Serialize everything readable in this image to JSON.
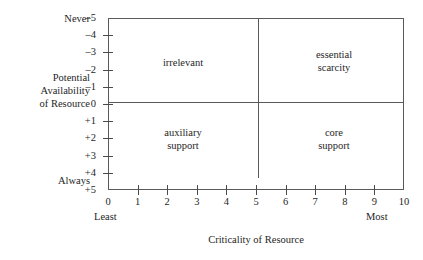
{
  "chart_data": {
    "type": "scatter",
    "title": "",
    "subtitle": "",
    "xlabel": "Criticality of Resource",
    "ylabel": "Potential\nAvailability\nof Resource",
    "ylabel_lines": [
      "Potential",
      "Availability",
      "of Resource"
    ],
    "xlim": [
      0,
      10
    ],
    "ylim": [
      -5,
      5
    ],
    "grid": false,
    "legend": null,
    "x_ticks": [
      {
        "value": 0,
        "label": "0"
      },
      {
        "value": 1,
        "label": "1"
      },
      {
        "value": 2,
        "label": "2"
      },
      {
        "value": 3,
        "label": "3"
      },
      {
        "value": 4,
        "label": "4"
      },
      {
        "value": 5,
        "label": "5"
      },
      {
        "value": 6,
        "label": "6"
      },
      {
        "value": 7,
        "label": "7"
      },
      {
        "value": 8,
        "label": "8"
      },
      {
        "value": 9,
        "label": "9"
      },
      {
        "value": 10,
        "label": "10"
      }
    ],
    "y_ticks": [
      {
        "value": -5,
        "label": "–5"
      },
      {
        "value": -4,
        "label": "–4"
      },
      {
        "value": -3,
        "label": "–3"
      },
      {
        "value": -2,
        "label": "–2"
      },
      {
        "value": -1,
        "label": "–1"
      },
      {
        "value": 0,
        "label": "0"
      },
      {
        "value": 1,
        "label": "+1"
      },
      {
        "value": 2,
        "label": "+2"
      },
      {
        "value": 3,
        "label": "+3"
      },
      {
        "value": 4,
        "label": "+4"
      },
      {
        "value": 5,
        "label": "+5"
      }
    ],
    "x_axis_endpoint_labels": {
      "low": "Least",
      "high": "Most"
    },
    "y_axis_endpoint_labels": {
      "top": "Never",
      "bottom": "Always"
    },
    "dividers": {
      "vertical_at_x": 5,
      "horizontal_at_y": 0
    },
    "quadrants": [
      {
        "id": "irrelevant",
        "label": "irrelevant",
        "x_range": [
          0,
          5
        ],
        "y_range": [
          -5,
          0
        ],
        "center": [
          2.5,
          -2.5
        ]
      },
      {
        "id": "essential-scarcity",
        "label": "essential\nscarcity",
        "x_range": [
          5,
          10
        ],
        "y_range": [
          -5,
          0
        ],
        "center": [
          7.5,
          -2.8
        ]
      },
      {
        "id": "auxiliary-support",
        "label": "auxiliary\nsupport",
        "x_range": [
          0,
          5
        ],
        "y_range": [
          0,
          5
        ],
        "center": [
          2.5,
          2.3
        ]
      },
      {
        "id": "core-support",
        "label": "core\nsupport",
        "x_range": [
          5,
          10
        ],
        "y_range": [
          0,
          5
        ],
        "center": [
          7.5,
          2.3
        ]
      }
    ],
    "colors": {
      "frame": "#5a5a5a",
      "text": "#262626",
      "background": "#ffffff"
    }
  }
}
